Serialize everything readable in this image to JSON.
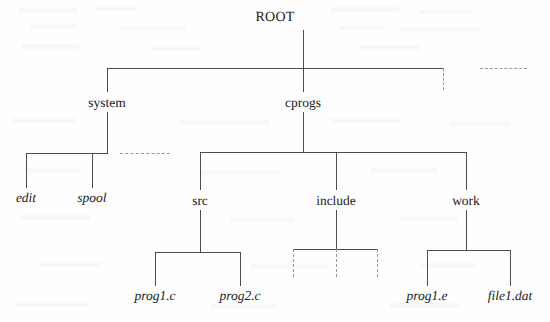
{
  "diagram": {
    "title": "ROOT",
    "kind": "directory-tree",
    "width": 550,
    "height": 322,
    "line_color": "#4c4c4c",
    "dashed_color": "#9a9a9a",
    "background_color": "#fefefe",
    "text_color": "#1b1b1b"
  },
  "nodes": [
    {
      "id": "root",
      "label": "ROOT",
      "style": "root",
      "level": 0,
      "x": 275,
      "y": 18
    },
    {
      "id": "system",
      "label": "system",
      "style": "dir",
      "level": 1,
      "x": 107,
      "y": 103
    },
    {
      "id": "cprogs",
      "label": "cprogs",
      "style": "dir",
      "level": 1,
      "x": 303,
      "y": 103
    },
    {
      "id": "edit",
      "label": "edit",
      "style": "file",
      "level": 2,
      "x": 26,
      "y": 198
    },
    {
      "id": "spool",
      "label": "spool",
      "style": "file",
      "level": 2,
      "x": 92,
      "y": 198
    },
    {
      "id": "src",
      "label": "src",
      "style": "dir",
      "level": 2,
      "x": 200,
      "y": 201
    },
    {
      "id": "include",
      "label": "include",
      "style": "dir",
      "level": 2,
      "x": 336,
      "y": 201
    },
    {
      "id": "work",
      "label": "work",
      "style": "dir",
      "level": 2,
      "x": 466,
      "y": 201
    },
    {
      "id": "prog1c",
      "label": "prog1.c",
      "style": "file",
      "level": 3,
      "x": 155,
      "y": 296
    },
    {
      "id": "prog2c",
      "label": "prog2.c",
      "style": "file",
      "level": 3,
      "x": 240,
      "y": 296
    },
    {
      "id": "prog1e",
      "label": "prog1.e",
      "style": "file",
      "level": 3,
      "x": 427,
      "y": 296
    },
    {
      "id": "file1dat",
      "label": "file1.dat",
      "style": "file",
      "level": 3,
      "x": 510,
      "y": 296
    }
  ],
  "edges": {
    "solid_vertical": [
      {
        "name": "root-stem",
        "x": 303,
        "y": 30,
        "h": 38
      },
      {
        "name": "system-drop",
        "x": 107,
        "y": 68,
        "h": 24
      },
      {
        "name": "cprogs-drop",
        "x": 303,
        "y": 68,
        "h": 24
      },
      {
        "name": "system-stem",
        "x": 107,
        "y": 112,
        "h": 41
      },
      {
        "name": "cprogs-stem",
        "x": 303,
        "y": 112,
        "h": 40
      },
      {
        "name": "edit-drop",
        "x": 26,
        "y": 153,
        "h": 35
      },
      {
        "name": "spool-drop",
        "x": 92,
        "y": 153,
        "h": 35
      },
      {
        "name": "src-drop",
        "x": 200,
        "y": 152,
        "h": 38
      },
      {
        "name": "include-drop",
        "x": 336,
        "y": 152,
        "h": 38
      },
      {
        "name": "work-drop",
        "x": 466,
        "y": 152,
        "h": 38
      },
      {
        "name": "src-stem",
        "x": 200,
        "y": 210,
        "h": 42
      },
      {
        "name": "include-stem",
        "x": 336,
        "y": 210,
        "h": 39
      },
      {
        "name": "work-stem",
        "x": 466,
        "y": 210,
        "h": 40
      },
      {
        "name": "prog1c-drop",
        "x": 155,
        "y": 252,
        "h": 34
      },
      {
        "name": "prog2c-drop",
        "x": 240,
        "y": 252,
        "h": 34
      },
      {
        "name": "prog1e-drop",
        "x": 427,
        "y": 250,
        "h": 36
      },
      {
        "name": "file1dat-drop",
        "x": 510,
        "y": 250,
        "h": 36
      }
    ],
    "solid_horizontal": [
      {
        "name": "root-children-bar",
        "x": 107,
        "y": 68,
        "w": 336
      },
      {
        "name": "system-children-bar",
        "x": 26,
        "y": 153,
        "w": 82
      },
      {
        "name": "cprogs-children-bar",
        "x": 200,
        "y": 152,
        "w": 266
      },
      {
        "name": "src-children-bar",
        "x": 155,
        "y": 252,
        "w": 85
      },
      {
        "name": "include-children-bar",
        "x": 293,
        "y": 249,
        "w": 84
      },
      {
        "name": "work-children-bar",
        "x": 427,
        "y": 250,
        "w": 83
      }
    ],
    "dashed_vertical": [
      {
        "name": "root-extra-child-stub",
        "x": 443,
        "y": 68,
        "h": 22
      },
      {
        "name": "include-child-stub-left",
        "x": 293,
        "y": 249,
        "h": 28
      },
      {
        "name": "include-child-stub-mid",
        "x": 336,
        "y": 249,
        "h": 28
      },
      {
        "name": "include-child-stub-right",
        "x": 377,
        "y": 249,
        "h": 28
      }
    ],
    "dashed_horizontal": [
      {
        "name": "root-bar-continuation",
        "x": 480,
        "y": 68,
        "w": 47
      },
      {
        "name": "system-bar-continuation",
        "x": 120,
        "y": 153,
        "w": 50
      }
    ]
  }
}
